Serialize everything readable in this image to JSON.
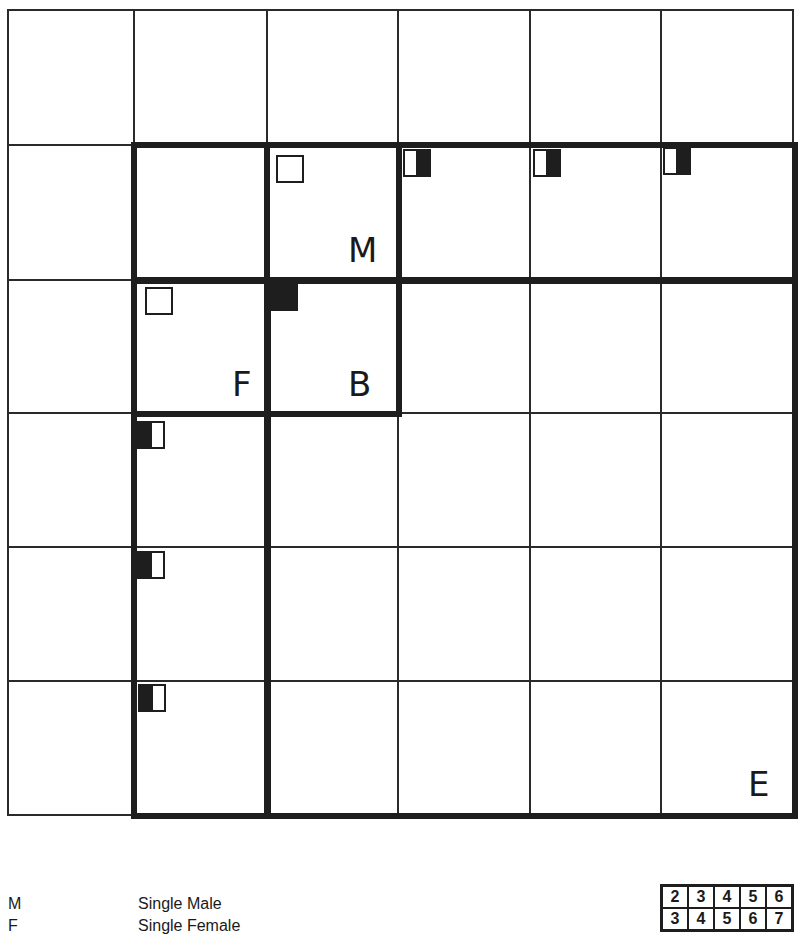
{
  "diagram": {
    "grid": {
      "columns": 6,
      "rows": 6,
      "col_edges_px": [
        8,
        134,
        267,
        398,
        530,
        661,
        793
      ],
      "row_edges_px": [
        10,
        145,
        280,
        413,
        547,
        681,
        815
      ]
    },
    "regions": [
      {
        "id": "M",
        "label": "M",
        "col": 2,
        "row": 1
      },
      {
        "id": "F",
        "label": "F",
        "col": 1,
        "row": 2
      },
      {
        "id": "B",
        "label": "B",
        "col": 2,
        "row": 2
      },
      {
        "id": "E",
        "label": "E",
        "cols": [
          2,
          5
        ],
        "rows": [
          2,
          5
        ]
      }
    ],
    "markers": [
      {
        "cell": "r1c2",
        "style": "empty"
      },
      {
        "cell": "r2c1",
        "style": "empty"
      },
      {
        "cell": "r2c2",
        "style": "filled"
      },
      {
        "cell": "r1c3",
        "style": "half-right-filled"
      },
      {
        "cell": "r1c4",
        "style": "half-right-filled"
      },
      {
        "cell": "r1c5",
        "style": "half-right-filled"
      },
      {
        "cell": "r3c1",
        "style": "half-left-filled"
      },
      {
        "cell": "r4c1",
        "style": "half-left-filled"
      },
      {
        "cell": "r5c1",
        "style": "half-left-filled"
      }
    ],
    "labels": {
      "m": "M",
      "f": "F",
      "b": "B",
      "e": "E"
    }
  },
  "legend": {
    "items": [
      {
        "key": "M",
        "text": "Single Male"
      },
      {
        "key": "F",
        "text": "Single Female"
      }
    ]
  },
  "mini_table": {
    "rows": [
      [
        "2",
        "3",
        "4",
        "5",
        "6"
      ],
      [
        "3",
        "4",
        "5",
        "6",
        "7"
      ]
    ]
  },
  "colors": {
    "line": "#2a2a2a",
    "thick": "#1e1e1e",
    "background": "#ffffff"
  }
}
